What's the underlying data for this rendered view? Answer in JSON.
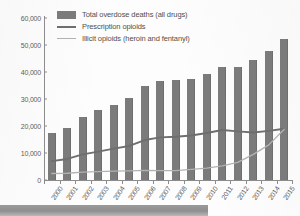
{
  "chart_data": {
    "type": "bar",
    "title": "",
    "xlabel": "",
    "ylabel": "",
    "ylim": [
      0,
      60000
    ],
    "ytick_values": [
      0,
      10000,
      20000,
      30000,
      40000,
      50000,
      60000
    ],
    "ytick_labels": [
      "0",
      "10,000",
      "20,000",
      "30,000",
      "40,000",
      "50,000",
      "60,000"
    ],
    "grid": false,
    "legend_position": "top-left",
    "categories": [
      "2000",
      "2001",
      "2002",
      "2003",
      "2004",
      "2005",
      "2006",
      "2007",
      "2008",
      "2009",
      "2010",
      "2011",
      "2012",
      "2013",
      "2014",
      "2015"
    ],
    "series": [
      {
        "name": "Total overdose deaths (all drugs)",
        "type": "bar",
        "color": "#7b7b7b",
        "values": [
          17400,
          19400,
          23500,
          25800,
          27800,
          30200,
          34800,
          36500,
          37000,
          37500,
          39100,
          42000,
          42000,
          44500,
          47700,
          52400
        ]
      },
      {
        "name": "Prescription opioids",
        "type": "line",
        "color": "#6e6e6e",
        "values": [
          7000,
          7800,
          9500,
          10500,
          11600,
          12600,
          14800,
          15800,
          16000,
          16500,
          17400,
          18500,
          18000,
          17600,
          18200,
          19000
        ]
      },
      {
        "name": "Illicit opioids (heroin and fentanyl)",
        "type": "line",
        "color": "#b2b2b2",
        "values": [
          2400,
          2500,
          2900,
          3100,
          3300,
          3400,
          3600,
          3500,
          3500,
          3900,
          4400,
          5200,
          6500,
          9500,
          13000,
          18800
        ]
      }
    ]
  },
  "legend": {
    "items": [
      {
        "label": "Total overdose deaths (all drugs)",
        "marker": "box",
        "color": "#7b7b7b"
      },
      {
        "label": "Prescription opioids",
        "marker": "line",
        "color": "#6e6e6e"
      },
      {
        "label": "Illicit opioids (heroin and fentanyl)",
        "marker": "line-light",
        "color": "#b2b2b2"
      }
    ]
  },
  "banner": {
    "text": ""
  }
}
